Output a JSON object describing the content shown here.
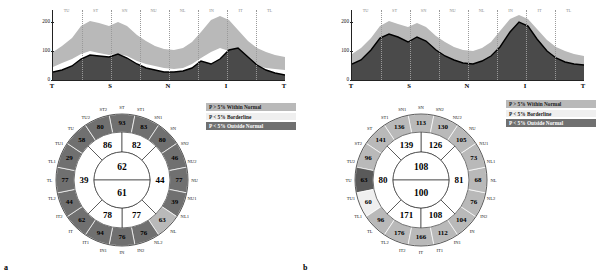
{
  "figure": {
    "panel_a_letter": "a",
    "panel_b_letter": "b"
  },
  "legend": {
    "items": [
      {
        "label": "P > 5% Within Normal",
        "color": "#b9b9b9"
      },
      {
        "label": "P < 5% Borderline",
        "color": "#efefef"
      },
      {
        "label": "P < 5% Outside Normal",
        "color": "#707070"
      }
    ]
  },
  "panel_a": {
    "name": "right-eye-rnfl-analysis",
    "chart": {
      "y_ticks": [
        "0",
        "100",
        "200"
      ],
      "x_ticks": [
        "T",
        "S",
        "N",
        "I",
        "T"
      ],
      "sector_labels": [
        "TU",
        "ST",
        "SN",
        "NU",
        "NL",
        "IN",
        "IT",
        "TL"
      ]
    },
    "dial": {
      "outer_labels": [
        "ST",
        "ST1",
        "SN1",
        "SN",
        "SN2",
        "NU2",
        "NU",
        "NU1",
        "NL1",
        "NL",
        "NL2",
        "IN2",
        "IN",
        "IN1",
        "IT1",
        "IT",
        "IT2",
        "TL2",
        "TL",
        "TL1",
        "TU1",
        "TU",
        "TU2",
        "ST2"
      ],
      "outer_values": [
        "93",
        "83",
        "80",
        "46",
        "77",
        "39",
        "63",
        "76",
        "76",
        "94",
        "62",
        "44",
        "77",
        "29",
        "58",
        "80"
      ],
      "middle_values": [
        "86",
        "82",
        "44",
        "77",
        "78",
        "39"
      ],
      "inner_values": [
        "62",
        "61"
      ],
      "quadrant_values": {
        "superior": "86",
        "nasal": "82",
        "inferior": "78",
        "temporal": "39"
      }
    }
  },
  "panel_b": {
    "name": "left-eye-rnfl-analysis",
    "chart": {
      "y_ticks": [
        "0",
        "100",
        "200"
      ],
      "x_ticks": [
        "T",
        "S",
        "N",
        "I",
        "T"
      ],
      "sector_labels": [
        "TU",
        "ST",
        "SN",
        "NU",
        "NL",
        "IN",
        "IT",
        "TL"
      ]
    },
    "dial": {
      "outer_labels": [
        "SN",
        "SN1",
        "ST1",
        "ST",
        "ST2",
        "TU2",
        "TU",
        "TU1",
        "TL1",
        "TL",
        "TL2",
        "IT2",
        "IT",
        "IT1",
        "IN1",
        "IN",
        "IN2",
        "NL2",
        "NL",
        "NL1",
        "NU1",
        "NU",
        "NU2",
        "SN2"
      ],
      "outer_values": [
        "113",
        "136",
        "141",
        "96",
        "63",
        "60",
        "96",
        "176",
        "166",
        "112",
        "104",
        "76",
        "68",
        "73",
        "105",
        "130"
      ],
      "middle_values": [
        "126",
        "139",
        "80",
        "171",
        "108",
        "81"
      ],
      "inner_values": [
        "108",
        "100"
      ],
      "quadrant_values": {
        "superior": "126",
        "temporal": "80",
        "inferior": "108",
        "nasal": "81"
      }
    }
  },
  "colors": {
    "within_normal": "#b9b9b9",
    "borderline": "#efefef",
    "outside_normal": "#707070",
    "measured_line": "#000000",
    "fill_dark": "#4a4a4a"
  },
  "chart_data": [
    {
      "type": "area",
      "title": "RNFL Thickness TSNIT Profile - Right Eye",
      "xlabel": "",
      "ylabel": "RNFL Thickness (microns)",
      "ylim": [
        0,
        240
      ],
      "x_tick_labels": [
        "T",
        "S",
        "N",
        "I",
        "T"
      ],
      "y_tick_labels": [
        "0",
        "100",
        "200"
      ],
      "grid": false,
      "legend_position": "right",
      "sector_labels": [
        "TU",
        "ST",
        "SN",
        "NU",
        "NL",
        "IN",
        "IT",
        "TL"
      ],
      "series": [
        {
          "name": "Normal upper bound (P > 5%)",
          "values": [
            95,
            120,
            150,
            185,
            200,
            185,
            175,
            190,
            175,
            150,
            130,
            115,
            108,
            105,
            110,
            130,
            165,
            205,
            220,
            205,
            170,
            130,
            105,
            90,
            80
          ]
        },
        {
          "name": "Normal lower bound",
          "values": [
            42,
            55,
            70,
            90,
            100,
            95,
            88,
            90,
            85,
            70,
            58,
            50,
            45,
            44,
            46,
            56,
            75,
            95,
            108,
            100,
            82,
            62,
            50,
            44,
            40
          ]
        },
        {
          "name": "Measured RNFL",
          "values": [
            30,
            35,
            50,
            72,
            85,
            83,
            80,
            88,
            78,
            60,
            48,
            42,
            38,
            37,
            40,
            50,
            68,
            62,
            72,
            100,
            105,
            80,
            55,
            38,
            28
          ]
        }
      ]
    },
    {
      "type": "area",
      "title": "RNFL Thickness TSNIT Profile - Left Eye",
      "xlabel": "",
      "ylabel": "RNFL Thickness (microns)",
      "ylim": [
        0,
        240
      ],
      "x_tick_labels": [
        "T",
        "S",
        "N",
        "I",
        "T"
      ],
      "y_tick_labels": [
        "0",
        "100",
        "200"
      ],
      "grid": false,
      "legend_position": "right",
      "sector_labels": [
        "TU",
        "ST",
        "SN",
        "NU",
        "NL",
        "IN",
        "IT",
        "TL"
      ],
      "series": [
        {
          "name": "Normal upper bound (P > 5%)",
          "values": [
            90,
            115,
            150,
            185,
            200,
            190,
            180,
            195,
            180,
            152,
            128,
            112,
            105,
            104,
            112,
            132,
            168,
            208,
            222,
            208,
            172,
            132,
            106,
            92,
            82
          ]
        },
        {
          "name": "Normal lower bound",
          "values": [
            45,
            58,
            75,
            95,
            105,
            100,
            92,
            96,
            90,
            74,
            60,
            52,
            47,
            46,
            50,
            60,
            78,
            100,
            112,
            104,
            86,
            66,
            52,
            46,
            42
          ]
        },
        {
          "name": "Measured RNFL",
          "values": [
            55,
            70,
            100,
            140,
            155,
            145,
            130,
            145,
            135,
            105,
            82,
            68,
            60,
            58,
            66,
            82,
            112,
            165,
            200,
            185,
            140,
            100,
            78,
            62,
            55
          ]
        }
      ]
    }
  ]
}
